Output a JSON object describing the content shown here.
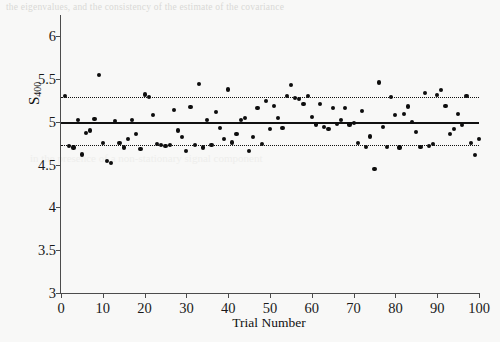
{
  "page": {
    "bleed_top_text": "the eigenvalues, and the consistency of the estimate of the covariance",
    "bleed_mid_text": "in the presence of a non-stationary signal component"
  },
  "chart_data": {
    "type": "scatter",
    "title": "",
    "xlabel": "Trial Number",
    "ylabel": "S400",
    "ylabel_base": "S",
    "ylabel_sub": "400",
    "xlim": [
      0,
      100
    ],
    "ylim": [
      3,
      6.25
    ],
    "xticks": [
      0,
      10,
      20,
      30,
      40,
      50,
      60,
      70,
      80,
      90,
      100
    ],
    "xtick_labels": [
      "0",
      "10",
      "20",
      "30",
      "40",
      "50",
      "60",
      "70",
      "80",
      "90",
      "100"
    ],
    "yticks": [
      3,
      3.5,
      4,
      4.5,
      5,
      5.5,
      6
    ],
    "ytick_labels": [
      "3",
      "3.5",
      "4",
      "4.5",
      "5",
      "5.5",
      "6"
    ],
    "grid": false,
    "legend": "none",
    "point_color": "#0d0d0d",
    "line_color": "#111111",
    "reference_lines": [
      {
        "name": "mean",
        "value": 5.0,
        "style": "solid"
      },
      {
        "name": "upper-bound",
        "value": 5.295,
        "style": "dotted"
      },
      {
        "name": "lower-bound",
        "value": 4.725,
        "style": "dotted"
      }
    ],
    "x": [
      1,
      2,
      3,
      4,
      5,
      6,
      7,
      8,
      9,
      10,
      11,
      12,
      13,
      14,
      15,
      16,
      17,
      18,
      19,
      20,
      21,
      22,
      23,
      24,
      25,
      26,
      27,
      28,
      29,
      30,
      31,
      32,
      33,
      34,
      35,
      36,
      37,
      38,
      39,
      40,
      41,
      42,
      43,
      44,
      45,
      46,
      47,
      48,
      49,
      50,
      51,
      52,
      53,
      54,
      55,
      56,
      57,
      58,
      59,
      60,
      61,
      62,
      63,
      64,
      65,
      66,
      67,
      68,
      69,
      70,
      71,
      72,
      73,
      74,
      75,
      76,
      77,
      78,
      79,
      80,
      81,
      82,
      83,
      84,
      85,
      86,
      87,
      88,
      89,
      90,
      91,
      92,
      93,
      94,
      95,
      96,
      97,
      98,
      99,
      100
    ],
    "y": [
      5.3,
      4.72,
      4.7,
      5.02,
      4.62,
      4.87,
      4.9,
      5.03,
      5.55,
      4.75,
      4.54,
      4.52,
      5.01,
      4.75,
      4.7,
      4.8,
      5.02,
      4.86,
      4.68,
      5.32,
      5.29,
      5.08,
      4.74,
      4.73,
      4.72,
      4.73,
      5.14,
      4.9,
      4.82,
      4.66,
      5.17,
      4.73,
      5.44,
      4.7,
      5.02,
      4.73,
      5.12,
      4.93,
      4.8,
      5.38,
      4.76,
      4.86,
      5.02,
      5.05,
      4.66,
      4.82,
      5.16,
      4.74,
      5.24,
      4.92,
      5.19,
      5.05,
      4.93,
      5.3,
      5.43,
      5.28,
      5.27,
      5.21,
      5.3,
      5.06,
      4.97,
      5.21,
      4.94,
      4.92,
      5.16,
      4.98,
      5.02,
      5.16,
      4.97,
      4.99,
      4.75,
      5.13,
      4.71,
      4.83,
      4.45,
      5.46,
      4.94,
      4.71,
      5.29,
      5.08,
      4.7,
      5.09,
      5.18,
      5.0,
      4.88,
      4.71,
      5.34,
      4.72,
      4.74,
      5.31,
      5.37,
      5.19,
      4.86,
      4.92,
      5.09,
      4.96,
      5.3,
      4.75,
      4.61,
      4.8
    ]
  }
}
